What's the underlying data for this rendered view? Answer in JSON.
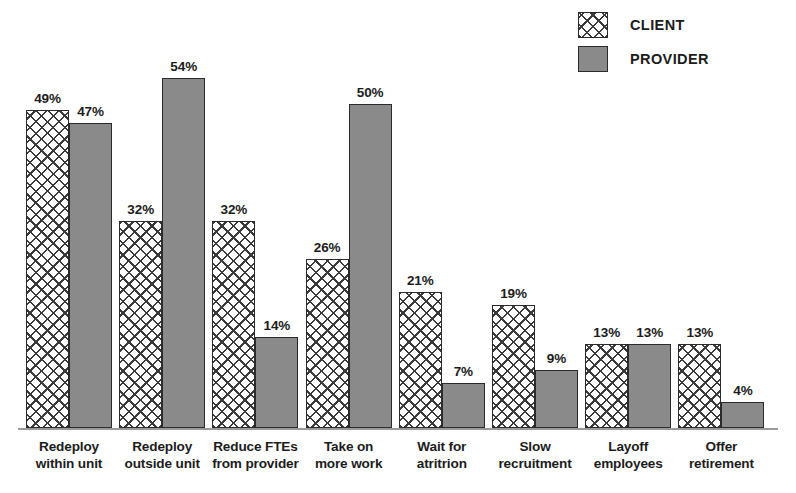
{
  "chart_data": {
    "type": "bar",
    "title": "",
    "subtitle": "",
    "xlabel": "",
    "ylabel": "",
    "ylim": [
      0,
      60
    ],
    "grid": false,
    "legend_position": "top-right",
    "value_suffix": "%",
    "categories": [
      "Redeploy within unit",
      "Redeploy outside unit",
      "Reduce FTEs from provider",
      "Take on more work",
      "Wait for atritrion",
      "Slow recruitment",
      "Layoff employees",
      "Offer retirement"
    ],
    "category_lines": [
      [
        "Redeploy",
        "within unit"
      ],
      [
        "Redeploy",
        "outside unit"
      ],
      [
        "Reduce FTEs",
        "from provider"
      ],
      [
        "Take on",
        "more work"
      ],
      [
        "Wait for",
        "atritrion"
      ],
      [
        "Slow",
        "recruitment"
      ],
      [
        "Layoff",
        "employees"
      ],
      [
        "Offer",
        "retirement"
      ]
    ],
    "series": [
      {
        "name": "CLIENT",
        "pattern": "crosshatch",
        "color": "#ffffff",
        "values": [
          49,
          32,
          32,
          26,
          21,
          19,
          13,
          13
        ],
        "labels": [
          "49%",
          "32%",
          "32%",
          "26%",
          "21%",
          "19%",
          "13%",
          "13%"
        ]
      },
      {
        "name": "PROVIDER",
        "pattern": "solid",
        "color": "#8a8a8a",
        "values": [
          47,
          54,
          14,
          50,
          7,
          9,
          13,
          4
        ],
        "labels": [
          "47%",
          "54%",
          "14%",
          "50%",
          "7%",
          "9%",
          "13%",
          "4%"
        ]
      }
    ]
  },
  "legend": {
    "items": [
      {
        "label": "CLIENT",
        "swatch": "crosshatch"
      },
      {
        "label": "PROVIDER",
        "swatch": "solid-gray"
      }
    ]
  },
  "colors": {
    "provider_gray": "#8a8a8a",
    "outline": "#2b2b2b",
    "axis": "#9a9a9a",
    "text": "#1c1c1c"
  }
}
